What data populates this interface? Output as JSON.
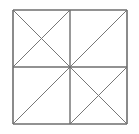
{
  "figure": {
    "background_color": "#ffffff",
    "outline_color": "#6e6e6e",
    "diagonal_color": "#777777",
    "outline_width": 1.6,
    "midline_width": 1.4,
    "diagonal_width": 1.0,
    "square": {
      "left": 13,
      "top": 10,
      "right": 127,
      "bottom": 124,
      "width": 114,
      "height": 114,
      "center_x": 70,
      "center_y": 67
    },
    "elements": {
      "outer_square_label": "outer square",
      "horizontal_midline_label": "horizontal midline",
      "vertical_midline_label": "vertical midline",
      "quadrants": [
        {
          "name": "top-left",
          "diagonals": [
            "main",
            "anti"
          ],
          "pattern": "X"
        },
        {
          "name": "top-right",
          "diagonals": [
            "anti"
          ],
          "pattern": "single-diagonal"
        },
        {
          "name": "bottom-left",
          "diagonals": [
            "anti"
          ],
          "pattern": "single-diagonal"
        },
        {
          "name": "bottom-right",
          "diagonals": [
            "main",
            "anti"
          ],
          "pattern": "X"
        }
      ],
      "segments": [
        {
          "name": "outer-top-edge",
          "x1": 13,
          "y1": 10,
          "x2": 127,
          "y2": 10,
          "role": "outline"
        },
        {
          "name": "outer-right-edge",
          "x1": 127,
          "y1": 10,
          "x2": 127,
          "y2": 124,
          "role": "outline"
        },
        {
          "name": "outer-bottom-edge",
          "x1": 13,
          "y1": 124,
          "x2": 127,
          "y2": 124,
          "role": "outline"
        },
        {
          "name": "outer-left-edge",
          "x1": 13,
          "y1": 10,
          "x2": 13,
          "y2": 124,
          "role": "outline"
        },
        {
          "name": "horizontal-midline",
          "x1": 13,
          "y1": 67,
          "x2": 127,
          "y2": 67,
          "role": "midline"
        },
        {
          "name": "vertical-midline",
          "x1": 70,
          "y1": 10,
          "x2": 70,
          "y2": 124,
          "role": "midline"
        },
        {
          "name": "tl-main-diagonal",
          "x1": 13,
          "y1": 10,
          "x2": 70,
          "y2": 67,
          "role": "diagonal"
        },
        {
          "name": "tl-anti-diagonal",
          "x1": 13,
          "y1": 67,
          "x2": 70,
          "y2": 10,
          "role": "diagonal"
        },
        {
          "name": "tr-anti-diagonal",
          "x1": 70,
          "y1": 67,
          "x2": 127,
          "y2": 10,
          "role": "diagonal"
        },
        {
          "name": "bl-anti-diagonal",
          "x1": 13,
          "y1": 124,
          "x2": 70,
          "y2": 67,
          "role": "diagonal"
        },
        {
          "name": "br-main-diagonal",
          "x1": 70,
          "y1": 67,
          "x2": 127,
          "y2": 124,
          "role": "diagonal"
        },
        {
          "name": "br-anti-diagonal",
          "x1": 70,
          "y1": 124,
          "x2": 127,
          "y2": 67,
          "role": "diagonal"
        }
      ]
    }
  }
}
